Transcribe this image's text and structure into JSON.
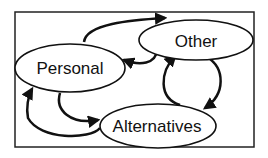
{
  "diagram": {
    "nodes": [
      {
        "id": "personal",
        "label": "Personal"
      },
      {
        "id": "other",
        "label": "Other"
      },
      {
        "id": "alternatives",
        "label": "Alternatives"
      }
    ],
    "edges": [
      {
        "from": "personal",
        "to": "other"
      },
      {
        "from": "other",
        "to": "personal"
      },
      {
        "from": "other",
        "to": "alternatives"
      },
      {
        "from": "alternatives",
        "to": "other"
      },
      {
        "from": "personal",
        "to": "alternatives"
      },
      {
        "from": "alternatives",
        "to": "personal"
      }
    ],
    "colors": {
      "stroke": "#111111",
      "background": "#ffffff"
    }
  }
}
